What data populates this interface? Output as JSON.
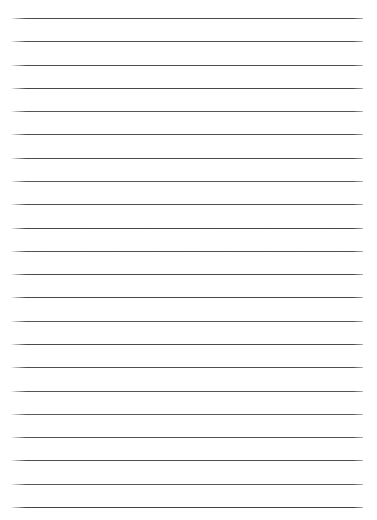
{
  "document": {
    "kind": "lined-paper",
    "title": "Blank Lined Paper",
    "page_width": 377,
    "page_height": 520,
    "background_color": "#ffffff",
    "line_color": "#4f4f4f",
    "line_thickness_px": 1.3,
    "line_count": 22,
    "left_margin_px": 12,
    "right_margin_px": 14,
    "first_line_y_px": 18,
    "line_spacing_px": 23.3,
    "written_text": "",
    "lines": [
      {
        "index": 1,
        "y": 18,
        "content": "",
        "shade": "#4a4a4a"
      },
      {
        "index": 2,
        "y": 41.3,
        "content": "",
        "shade": "#505050"
      },
      {
        "index": 3,
        "y": 64.6,
        "content": "",
        "shade": "#4c4c4c"
      },
      {
        "index": 4,
        "y": 87.9,
        "content": "",
        "shade": "#474747"
      },
      {
        "index": 5,
        "y": 111.2,
        "content": "",
        "shade": "#565656"
      },
      {
        "index": 6,
        "y": 134.4,
        "content": "",
        "shade": "#4e4e4e"
      },
      {
        "index": 7,
        "y": 157.7,
        "content": "",
        "shade": "#4a4a4a"
      },
      {
        "index": 8,
        "y": 181.0,
        "content": "",
        "shade": "#585858"
      },
      {
        "index": 9,
        "y": 204.3,
        "content": "",
        "shade": "#4d4d4d"
      },
      {
        "index": 10,
        "y": 227.6,
        "content": "",
        "shade": "#464646"
      },
      {
        "index": 11,
        "y": 250.9,
        "content": "",
        "shade": "#525252"
      },
      {
        "index": 12,
        "y": 274.2,
        "content": "",
        "shade": "#4b4b4b"
      },
      {
        "index": 13,
        "y": 297.4,
        "content": "",
        "shade": "#484848"
      },
      {
        "index": 14,
        "y": 320.7,
        "content": "",
        "shade": "#565656"
      },
      {
        "index": 15,
        "y": 344.0,
        "content": "",
        "shade": "#4a4a4a"
      },
      {
        "index": 16,
        "y": 367.3,
        "content": "",
        "shade": "#4f4f4f"
      },
      {
        "index": 17,
        "y": 390.6,
        "content": "",
        "shade": "#545454"
      },
      {
        "index": 18,
        "y": 413.9,
        "content": "",
        "shade": "#5b5b5b"
      },
      {
        "index": 19,
        "y": 437.1,
        "content": "",
        "shade": "#535353"
      },
      {
        "index": 20,
        "y": 460.4,
        "content": "",
        "shade": "#4d4d4d"
      },
      {
        "index": 21,
        "y": 483.7,
        "content": "",
        "shade": "#585858"
      },
      {
        "index": 22,
        "y": 507.0,
        "content": "",
        "shade": "#434343"
      }
    ]
  }
}
